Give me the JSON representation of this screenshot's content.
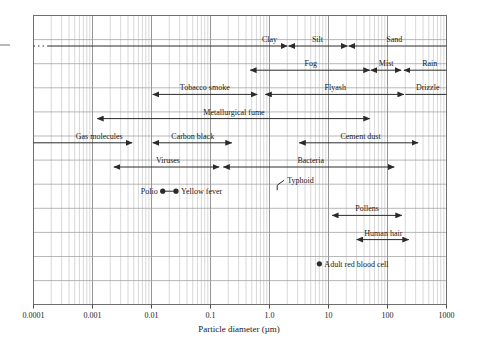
{
  "chart_data": {
    "type": "range-bar",
    "title": "",
    "xlabel": "Particle diameter (µm)",
    "ylabel": "",
    "xscale": "log",
    "xlim": [
      0.0001,
      1000
    ],
    "grid": true,
    "legend": "none",
    "tick_labels": [
      "0.0001",
      "0.001",
      "0.01",
      "0.1",
      "1.0",
      "10",
      "100",
      "1000"
    ],
    "tick_values": [
      0.0001,
      0.001,
      0.01,
      0.1,
      1.0,
      10,
      100,
      1000
    ],
    "minor_ticks": true,
    "ranges": [
      {
        "label": "Clay",
        "x_start": 0.0001,
        "x_end": 2.0,
        "row": 1,
        "arrow_start": "none",
        "arrow_end": "right",
        "dashed_start": true,
        "label_x": 1.0,
        "label_anchor": "middle"
      },
      {
        "label": "Silt",
        "x_start": 2.1,
        "x_end": 21.0,
        "row": 1,
        "arrow_start": "left",
        "arrow_end": "right",
        "label_x": 6.5,
        "label_anchor": "middle"
      },
      {
        "label": "Sand",
        "x_start": 22.0,
        "x_end": 1000.0,
        "row": 1,
        "arrow_start": "left",
        "arrow_end": "none",
        "label_x": 130.0,
        "label_anchor": "middle"
      },
      {
        "label": "Fog",
        "x_start": 0.47,
        "x_end": 50.0,
        "row": 2,
        "arrow_start": "left",
        "arrow_end": "right",
        "label_x": 5.0,
        "label_anchor": "middle"
      },
      {
        "label": "Mist",
        "x_start": 52.0,
        "x_end": 170.0,
        "row": 2,
        "arrow_start": "left",
        "arrow_end": "right",
        "label_x": 95.0,
        "label_anchor": "middle"
      },
      {
        "label": "Rain",
        "x_start": 190.0,
        "x_end": 1000.0,
        "row": 2,
        "arrow_start": "left",
        "arrow_end": "none",
        "label_x": 520.0,
        "label_anchor": "middle"
      },
      {
        "label": "Tobacco smoke",
        "x_start": 0.0105,
        "x_end": 0.62,
        "row": 3,
        "arrow_start": "left",
        "arrow_end": "right",
        "label_x": 0.08,
        "label_anchor": "middle"
      },
      {
        "label": "Flyash",
        "x_start": 0.85,
        "x_end": 190.0,
        "row": 3,
        "arrow_start": "left",
        "arrow_end": "right",
        "label_x": 13.0,
        "label_anchor": "middle"
      },
      {
        "label": "Drizzle",
        "x_start": 200.0,
        "x_end": 1000.0,
        "row": 3,
        "arrow_start": "none",
        "arrow_end": "none",
        "label_x": 480.0,
        "label_anchor": "middle"
      },
      {
        "label": "Metallurgical fume",
        "x_start": 0.0012,
        "x_end": 50.0,
        "row": 4,
        "arrow_start": "left",
        "arrow_end": "right",
        "label_x": 0.25,
        "label_anchor": "middle"
      },
      {
        "label": "Gas molecules",
        "x_start": 0.0001,
        "x_end": 0.0047,
        "row": 5,
        "arrow_start": "none",
        "arrow_end": "right",
        "label_x": 0.0013,
        "label_anchor": "middle"
      },
      {
        "label": "Carbon black",
        "x_start": 0.0105,
        "x_end": 0.23,
        "row": 5,
        "arrow_start": "left",
        "arrow_end": "right",
        "label_x": 0.05,
        "label_anchor": "middle"
      },
      {
        "label": "Cement dust",
        "x_start": 3.2,
        "x_end": 330.0,
        "row": 5,
        "arrow_start": "left",
        "arrow_end": "right",
        "label_x": 35.0,
        "label_anchor": "middle"
      },
      {
        "label": "Viruses",
        "x_start": 0.0023,
        "x_end": 0.14,
        "row": 6,
        "arrow_start": "left",
        "arrow_end": "right",
        "label_x": 0.019,
        "label_anchor": "middle"
      },
      {
        "label": "Bacteria",
        "x_start": 0.165,
        "x_end": 130.0,
        "row": 6,
        "arrow_start": "left",
        "arrow_end": "right",
        "label_x": 5.0,
        "label_anchor": "middle"
      },
      {
        "label": "Pollens",
        "x_start": 11.5,
        "x_end": 175.0,
        "row": 8,
        "arrow_start": "left",
        "arrow_end": "right",
        "label_x": 45.0,
        "label_anchor": "middle"
      },
      {
        "label": "Human hair",
        "x_start": 30.0,
        "x_end": 230.0,
        "row": 9,
        "arrow_start": "left",
        "arrow_end": "right",
        "label_x": 85.0,
        "label_anchor": "middle"
      }
    ],
    "points": [
      {
        "label": "Polio",
        "x": 0.0155,
        "row": 7,
        "label_side": "left"
      },
      {
        "label": "Yellow fever",
        "x": 0.026,
        "row": 7,
        "label_side": "right"
      },
      {
        "label": "Typhoid",
        "x": 1.35,
        "row": 7,
        "label_side": "leader",
        "leader": true
      },
      {
        "label": "Adult red blood cell",
        "x": 7.0,
        "row": 10,
        "label_side": "right"
      }
    ]
  },
  "axis": {
    "x_title": "Particle diameter (µm)",
    "ticks": [
      "0.0001",
      "0.001",
      "0.01",
      "0.1",
      "1.0",
      "10",
      "100",
      "1000"
    ]
  }
}
